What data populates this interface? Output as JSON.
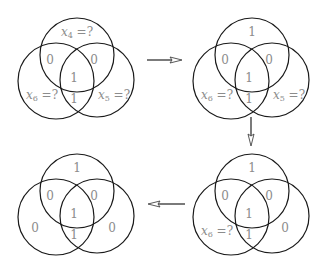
{
  "diagram": {
    "panels": [
      {
        "id": "step-1",
        "position": "top-left",
        "regions": {
          "top_only": {
            "var": "x",
            "sub": "4",
            "rest": " =?"
          },
          "top_left": "0",
          "top_right": "0",
          "center": "1",
          "left_right": "1",
          "left_only": {
            "var": "x",
            "sub": "6",
            "rest": " =?"
          },
          "right_only": {
            "var": "x",
            "sub": "5",
            "rest": " =?"
          }
        }
      },
      {
        "id": "step-2",
        "position": "top-right",
        "regions": {
          "top_only": "1",
          "top_left": "0",
          "top_right": "0",
          "center": "1",
          "left_right": "1",
          "left_only": {
            "var": "x",
            "sub": "6",
            "rest": " =?"
          },
          "right_only": {
            "var": "x",
            "sub": "5",
            "rest": " =?"
          }
        }
      },
      {
        "id": "step-3",
        "position": "bottom-right",
        "regions": {
          "top_only": "1",
          "top_left": "0",
          "top_right": "0",
          "center": "1",
          "left_right": "1",
          "left_only": {
            "var": "x",
            "sub": "6",
            "rest": " =?"
          },
          "right_only": "0"
        }
      },
      {
        "id": "step-4",
        "position": "bottom-left",
        "regions": {
          "top_only": "1",
          "top_left": "0",
          "top_right": "0",
          "center": "1",
          "left_right": "1",
          "left_only": "0",
          "right_only": "0"
        }
      }
    ],
    "arrows": [
      {
        "from": "step-1",
        "to": "step-2",
        "direction": "right"
      },
      {
        "from": "step-2",
        "to": "step-3",
        "direction": "down"
      },
      {
        "from": "step-3",
        "to": "step-4",
        "direction": "left"
      }
    ],
    "colors": {
      "stroke": "#1a1a1a",
      "label": "#8c8c8c",
      "background": "#ffffff"
    }
  }
}
